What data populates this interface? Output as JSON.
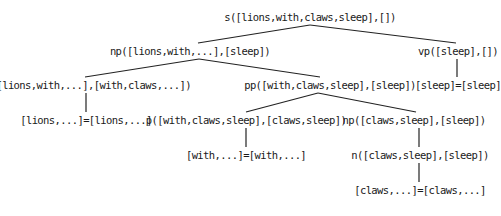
{
  "diagram": {
    "type": "parse-tree",
    "nodes": [
      {
        "id": "s",
        "label": "s([lions,with,claws,sleep],[])",
        "x": 310,
        "y": 10
      },
      {
        "id": "np1",
        "label": "np([lions,with,...],[sleep])",
        "x": 190,
        "y": 44
      },
      {
        "id": "vp",
        "label": "vp([sleep],[])",
        "x": 458,
        "y": 44
      },
      {
        "id": "n1",
        "label": "n([lions,with,...],[with,claws,...])",
        "x": 88,
        "y": 78
      },
      {
        "id": "pp",
        "label": "pp([with,claws,sleep],[sleep])",
        "x": 330,
        "y": 78
      },
      {
        "id": "vp_leaf",
        "label": "[sleep]=[sleep]",
        "x": 458,
        "y": 78
      },
      {
        "id": "n1_leaf",
        "label": "[lions,...]=[lions,...]",
        "x": 86,
        "y": 113
      },
      {
        "id": "p",
        "label": "p([with,claws,sleep],[claws,sleep])",
        "x": 246,
        "y": 113
      },
      {
        "id": "np2",
        "label": "np([claws,sleep],[sleep])",
        "x": 414,
        "y": 113
      },
      {
        "id": "p_leaf",
        "label": "[with,...]=[with,...]",
        "x": 246,
        "y": 148
      },
      {
        "id": "n2",
        "label": "n([claws,sleep],[sleep])",
        "x": 420,
        "y": 148
      },
      {
        "id": "n2_leaf",
        "label": "[claws,...]=[claws,...]",
        "x": 420,
        "y": 183
      }
    ],
    "edges": [
      {
        "from": "s",
        "to": "np1",
        "x1": 310,
        "y1": 25,
        "x2": 198,
        "y2": 43
      },
      {
        "from": "s",
        "to": "vp",
        "x1": 310,
        "y1": 25,
        "x2": 456,
        "y2": 43
      },
      {
        "from": "np1",
        "to": "n1",
        "x1": 199,
        "y1": 59,
        "x2": 85,
        "y2": 77
      },
      {
        "from": "np1",
        "to": "pp",
        "x1": 199,
        "y1": 59,
        "x2": 320,
        "y2": 77
      },
      {
        "from": "vp",
        "to": "vp_leaf",
        "x1": 457,
        "y1": 59,
        "x2": 457,
        "y2": 77
      },
      {
        "from": "n1",
        "to": "n1_leaf",
        "x1": 86,
        "y1": 93,
        "x2": 86,
        "y2": 112
      },
      {
        "from": "pp",
        "to": "p",
        "x1": 318,
        "y1": 93,
        "x2": 246,
        "y2": 112
      },
      {
        "from": "pp",
        "to": "np2",
        "x1": 318,
        "y1": 93,
        "x2": 416,
        "y2": 112
      },
      {
        "from": "p",
        "to": "p_leaf",
        "x1": 246,
        "y1": 128,
        "x2": 246,
        "y2": 147
      },
      {
        "from": "np2",
        "to": "n2",
        "x1": 419,
        "y1": 128,
        "x2": 419,
        "y2": 147
      },
      {
        "from": "n2",
        "to": "n2_leaf",
        "x1": 419,
        "y1": 163,
        "x2": 419,
        "y2": 182
      }
    ],
    "colors": {
      "text": "#1a1a1a",
      "edge": "#222222",
      "background": "#ffffff"
    }
  }
}
